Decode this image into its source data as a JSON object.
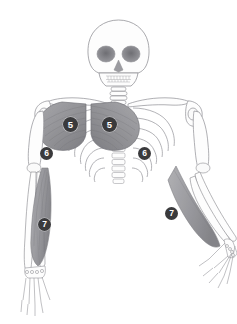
{
  "illustration": {
    "title": "Upper body skeleton with highlighted muscle groups",
    "type": "anatomical-diagram",
    "view": "anterior",
    "background_color": "#ffffff",
    "bone_outline_color": "#8a8a8e",
    "bone_fill_color": "#fdfdfd",
    "muscle_fill_color": "#9a9a9e",
    "muscle_shade_color": "#77777b",
    "marker_background_color": "#3a3a3c",
    "marker_text_color": "#ffffff"
  },
  "markers": [
    {
      "id": "marker-5-left",
      "label": "5",
      "region": "pectoralis-major-left",
      "x": 63,
      "y": 117,
      "size": "big"
    },
    {
      "id": "marker-5-right",
      "label": "5",
      "region": "pectoralis-major-right",
      "x": 102,
      "y": 117,
      "size": "big"
    },
    {
      "id": "marker-6-left",
      "label": "6",
      "region": "serratus-anterior-left",
      "x": 40,
      "y": 147,
      "size": "mid"
    },
    {
      "id": "marker-6-right",
      "label": "6",
      "region": "serratus-anterior-right",
      "x": 138,
      "y": 147,
      "size": "mid"
    },
    {
      "id": "marker-7-left",
      "label": "7",
      "region": "forearm-flexors-left",
      "x": 38,
      "y": 218,
      "size": "mid"
    },
    {
      "id": "marker-7-right",
      "label": "7",
      "region": "forearm-flexors-right",
      "x": 165,
      "y": 207,
      "size": "mid"
    }
  ],
  "anatomy_parts": [
    {
      "name": "skull",
      "label": "Skull"
    },
    {
      "name": "mandible",
      "label": "Mandible"
    },
    {
      "name": "cervical-spine",
      "label": "Cervical spine"
    },
    {
      "name": "clavicle-left",
      "label": "Left clavicle"
    },
    {
      "name": "clavicle-right",
      "label": "Right clavicle"
    },
    {
      "name": "scapula-left",
      "label": "Left scapula"
    },
    {
      "name": "scapula-right",
      "label": "Right scapula"
    },
    {
      "name": "sternum",
      "label": "Sternum"
    },
    {
      "name": "ribcage",
      "label": "Ribcage"
    },
    {
      "name": "thoracic-spine",
      "label": "Thoracic spine"
    },
    {
      "name": "humerus-left",
      "label": "Left humerus"
    },
    {
      "name": "humerus-right",
      "label": "Right humerus"
    },
    {
      "name": "radius-ulna-left",
      "label": "Left radius and ulna"
    },
    {
      "name": "radius-ulna-right",
      "label": "Right radius and ulna"
    },
    {
      "name": "hand-left",
      "label": "Left hand"
    },
    {
      "name": "hand-right",
      "label": "Right hand"
    },
    {
      "name": "pectoralis-major-left",
      "label": "Left pectoralis major"
    },
    {
      "name": "pectoralis-major-right",
      "label": "Right pectoralis major"
    },
    {
      "name": "forearm-muscle-left",
      "label": "Left forearm muscles"
    },
    {
      "name": "forearm-muscle-right",
      "label": "Right forearm muscles"
    }
  ]
}
